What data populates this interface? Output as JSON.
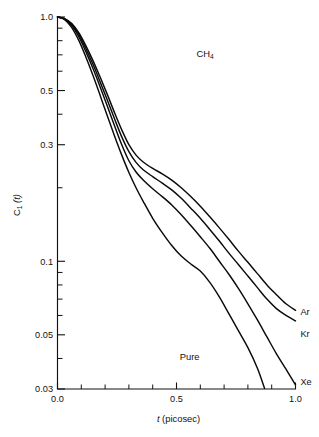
{
  "chart_data": {
    "type": "line",
    "title": "",
    "annotation": "CH4",
    "annotation_display": "CH",
    "annotation_sub": "4",
    "xlabel_italic": "t",
    "xlabel_rest": "(picosec)",
    "xlabel": "t (picosec)",
    "ylabel": "C1(t)",
    "ylabel_main": "C",
    "ylabel_sub": "1",
    "ylabel_tail": "(t)",
    "xscale": "linear",
    "yscale": "log",
    "xlim": [
      0.0,
      1.0
    ],
    "ylim": [
      0.03,
      1.0
    ],
    "grid": false,
    "legend_position": "inline-right",
    "x_ticks_major": [
      "0.0",
      "0.5",
      "1.0"
    ],
    "x_ticks_major_values": [
      0.0,
      0.5,
      1.0
    ],
    "x_ticks_minor_values": [
      0.1,
      0.2,
      0.3,
      0.4,
      0.6,
      0.7,
      0.8,
      0.9
    ],
    "y_ticks_major": [
      "1.0",
      "0.5",
      "0.3",
      "0.1",
      "0.05",
      "0.03"
    ],
    "y_ticks_major_values": [
      1.0,
      0.5,
      0.3,
      0.1,
      0.05,
      0.03
    ],
    "y_ticks_minor_values": [
      0.9,
      0.8,
      0.7,
      0.6,
      0.4,
      0.2,
      0.09,
      0.08,
      0.07,
      0.06,
      0.04
    ],
    "series": [
      {
        "name": "Ar",
        "label": "Ar",
        "label_x": 1.01,
        "label_y": 0.062,
        "x": [
          0.0,
          0.03,
          0.06,
          0.09,
          0.12,
          0.15,
          0.18,
          0.21,
          0.24,
          0.27,
          0.3,
          0.33,
          0.36,
          0.4,
          0.44,
          0.48,
          0.52,
          0.56,
          0.6,
          0.64,
          0.68,
          0.72,
          0.76,
          0.8,
          0.84,
          0.88,
          0.92,
          0.96,
          1.0
        ],
        "y": [
          1.0,
          0.985,
          0.94,
          0.86,
          0.76,
          0.66,
          0.565,
          0.48,
          0.405,
          0.345,
          0.3,
          0.272,
          0.255,
          0.24,
          0.228,
          0.215,
          0.2,
          0.184,
          0.168,
          0.152,
          0.137,
          0.123,
          0.11,
          0.099,
          0.089,
          0.08,
          0.073,
          0.067,
          0.063
        ]
      },
      {
        "name": "Kr",
        "label": "Kr",
        "label_x": 1.01,
        "label_y": 0.0505,
        "x": [
          0.0,
          0.03,
          0.06,
          0.09,
          0.12,
          0.15,
          0.18,
          0.21,
          0.24,
          0.27,
          0.3,
          0.33,
          0.36,
          0.4,
          0.44,
          0.48,
          0.52,
          0.56,
          0.6,
          0.64,
          0.68,
          0.72,
          0.76,
          0.8,
          0.84,
          0.88,
          0.92,
          0.96,
          1.0
        ],
        "y": [
          1.0,
          0.983,
          0.932,
          0.845,
          0.74,
          0.637,
          0.54,
          0.455,
          0.382,
          0.323,
          0.281,
          0.254,
          0.237,
          0.222,
          0.209,
          0.196,
          0.181,
          0.165,
          0.15,
          0.135,
          0.121,
          0.108,
          0.097,
          0.087,
          0.078,
          0.07,
          0.064,
          0.06,
          0.057
        ]
      },
      {
        "name": "Xe",
        "label": "Xe",
        "label_x": 1.01,
        "label_y": 0.0322,
        "x": [
          0.0,
          0.03,
          0.06,
          0.09,
          0.12,
          0.15,
          0.18,
          0.21,
          0.24,
          0.27,
          0.3,
          0.33,
          0.36,
          0.4,
          0.44,
          0.48,
          0.52,
          0.56,
          0.6,
          0.64,
          0.68,
          0.72,
          0.76,
          0.8,
          0.84,
          0.88,
          0.92,
          0.96,
          1.0
        ],
        "y": [
          1.0,
          0.98,
          0.922,
          0.828,
          0.718,
          0.612,
          0.515,
          0.43,
          0.358,
          0.3,
          0.258,
          0.232,
          0.215,
          0.198,
          0.184,
          0.17,
          0.155,
          0.14,
          0.126,
          0.113,
          0.1,
          0.0885,
          0.0775,
          0.067,
          0.0575,
          0.049,
          0.0418,
          0.0362,
          0.0312
        ]
      },
      {
        "name": "Pure",
        "label": "Pure",
        "label_x": 0.555,
        "label_y": 0.0405,
        "x": [
          0.0,
          0.03,
          0.06,
          0.09,
          0.12,
          0.15,
          0.18,
          0.21,
          0.24,
          0.27,
          0.3,
          0.33,
          0.36,
          0.4,
          0.44,
          0.48,
          0.52,
          0.56,
          0.6,
          0.64,
          0.68,
          0.72,
          0.76,
          0.8,
          0.84,
          0.87
        ],
        "y": [
          1.0,
          0.976,
          0.905,
          0.8,
          0.683,
          0.573,
          0.475,
          0.392,
          0.325,
          0.272,
          0.231,
          0.2,
          0.176,
          0.15,
          0.131,
          0.116,
          0.105,
          0.0975,
          0.0912,
          0.082,
          0.0715,
          0.061,
          0.052,
          0.0443,
          0.0365,
          0.0302
        ]
      }
    ]
  }
}
